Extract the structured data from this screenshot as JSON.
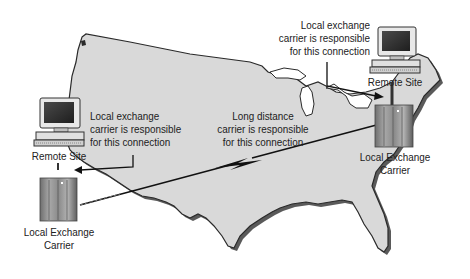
{
  "diagram": {
    "type": "network-map",
    "background": "United States map",
    "colors": {
      "map_fill": "#d9d9d9",
      "map_outline": "#2a2a2a",
      "map_shadow": "#555555",
      "text": "#222222",
      "line": "#111111"
    },
    "nodes": {
      "west_remote_site": {
        "label": "Remote Site",
        "icon": "computer-icon"
      },
      "west_lec": {
        "label_line1": "Local Exchange",
        "label_line2": "Carrier",
        "icon": "server-tower-icon"
      },
      "east_remote_site": {
        "label": "Remote Site",
        "icon": "computer-icon"
      },
      "east_lec": {
        "label_line1": "Local Exchange",
        "label_line2": "Carrier",
        "icon": "server-tower-icon"
      }
    },
    "annotations": {
      "west_local": {
        "line1": "Local exchange",
        "line2": "carrier is responsible",
        "line3": "for this connection"
      },
      "long_distance": {
        "line1": "Long distance",
        "line2": "carrier is responsible",
        "line3": "for this connection"
      },
      "east_local": {
        "line1": "Local exchange",
        "line2": "carrier is responsible",
        "line3": "for this connection"
      }
    },
    "connections": [
      {
        "from": "west_remote_site",
        "to": "west_lec",
        "kind": "local"
      },
      {
        "from": "west_lec",
        "to": "east_lec",
        "kind": "long-distance",
        "symbol": "lightning-bolt"
      },
      {
        "from": "east_remote_site",
        "to": "east_lec",
        "kind": "local"
      }
    ]
  }
}
